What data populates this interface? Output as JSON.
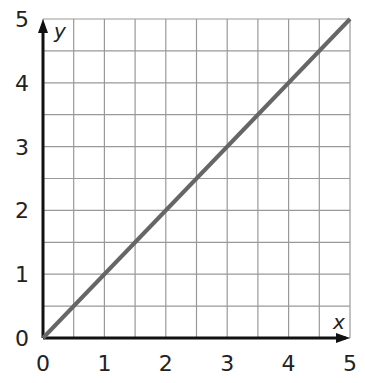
{
  "chart_data": {
    "type": "line",
    "title": "",
    "xlabel": "x",
    "ylabel": "y",
    "xlim": [
      0,
      5
    ],
    "ylim": [
      0,
      5
    ],
    "grid": true,
    "grid_step": 0.5,
    "x_ticks": [
      "0",
      "1",
      "2",
      "3",
      "4",
      "5"
    ],
    "y_ticks": [
      "0",
      "1",
      "2",
      "3",
      "4",
      "5"
    ],
    "series": [
      {
        "name": "y = x",
        "x": [
          0,
          5
        ],
        "y": [
          0,
          5
        ],
        "color": "#666666"
      }
    ]
  },
  "labels": {
    "x_axis": "x",
    "y_axis": "y",
    "x_ticks": [
      "0",
      "1",
      "2",
      "3",
      "4",
      "5"
    ],
    "y_ticks": [
      "0",
      "1",
      "2",
      "3",
      "4",
      "5"
    ]
  }
}
